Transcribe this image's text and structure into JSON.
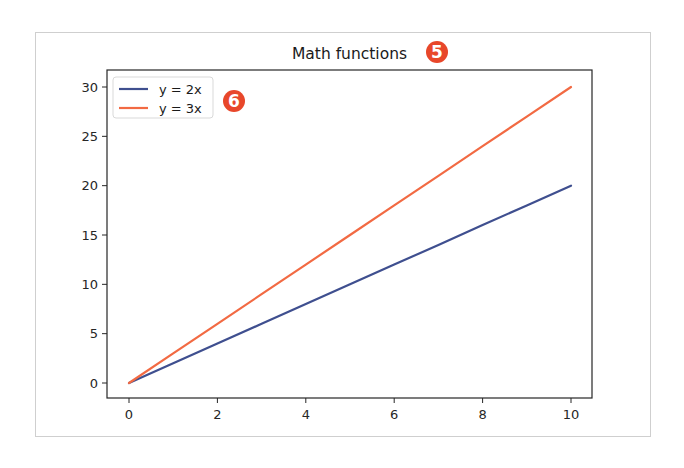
{
  "chart_data": {
    "type": "line",
    "title": "Math functions",
    "xlabel": "",
    "ylabel": "",
    "x": [
      0,
      1,
      2,
      3,
      4,
      5,
      6,
      7,
      8,
      9,
      10
    ],
    "series": [
      {
        "name": "y = 2x",
        "color": "#3f4f8f",
        "values": [
          0,
          2,
          4,
          6,
          8,
          10,
          12,
          14,
          16,
          18,
          20
        ]
      },
      {
        "name": "y = 3x",
        "color": "#f26a43",
        "values": [
          0,
          3,
          6,
          9,
          12,
          15,
          18,
          21,
          24,
          27,
          30
        ]
      }
    ],
    "xticks": [
      0,
      2,
      4,
      6,
      8,
      10
    ],
    "yticks": [
      0,
      5,
      10,
      15,
      20,
      25,
      30
    ],
    "xlim": [
      -0.5,
      10.5
    ],
    "ylim": [
      -1.5,
      31.5
    ],
    "grid": false,
    "legend_position": "upper left"
  },
  "annotations": {
    "badges": [
      {
        "label": "5",
        "target": "title",
        "color": "#e8472a"
      },
      {
        "label": "6",
        "target": "legend",
        "color": "#e8472a"
      }
    ]
  }
}
